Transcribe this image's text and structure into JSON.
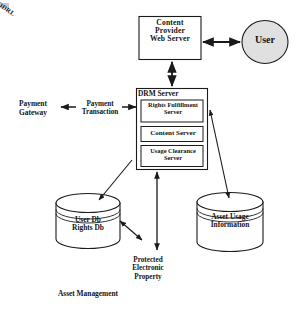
{
  "diagram": {
    "caption": "Asset Management",
    "nodes": {
      "content_provider": {
        "label": "Content\nProvider\nWeb Server",
        "shape": "rectangle"
      },
      "user": {
        "label": "User",
        "shape": "ellipse",
        "fill": "#e0e0e0"
      },
      "drm_server": {
        "label": "DRM Server",
        "shape": "rectangle",
        "children": [
          {
            "label": "Rights Fulfillment\nServer",
            "shape": "rectangle"
          },
          {
            "label": "Content Server",
            "shape": "rectangle"
          },
          {
            "label": "Usage Clearance\nServer",
            "shape": "rectangle"
          }
        ]
      },
      "payment_gateway": {
        "label": "Payment\nGateway",
        "shape": "text"
      },
      "user_rights_db": {
        "label": "User Db\nRights Db",
        "shape": "cylinder"
      },
      "asset_usage_information": {
        "label": "Asset Usage\nInformation",
        "shape": "cylinder"
      },
      "protected_electronic_property": {
        "label": "Protected\nElectronic\nProperty",
        "shape": "text"
      }
    },
    "edge_labels": {
      "payment_transaction": "Payment\nTransaction",
      "odrl": "ODRL"
    },
    "edges": [
      {
        "from": "content_provider",
        "to": "user",
        "direction": "both"
      },
      {
        "from": "content_provider",
        "to": "drm_server",
        "direction": "both"
      },
      {
        "from": "drm_server",
        "to": "payment_gateway",
        "direction": "to",
        "label": "Payment Transaction"
      },
      {
        "from": "drm_server",
        "to": "user_rights_db",
        "direction": "to"
      },
      {
        "from": "drm_server",
        "to": "asset_usage_information",
        "direction": "both"
      },
      {
        "from": "drm_server",
        "to": "protected_electronic_property",
        "direction": "both"
      },
      {
        "from": "user_rights_db",
        "to": "protected_electronic_property",
        "direction": "both",
        "label": "ODRL"
      }
    ],
    "colors": {
      "stroke": "#1a1a1a",
      "background": "#ffffff",
      "user_fill": "#e0e0e0",
      "box_fill": "#ffffff"
    }
  }
}
